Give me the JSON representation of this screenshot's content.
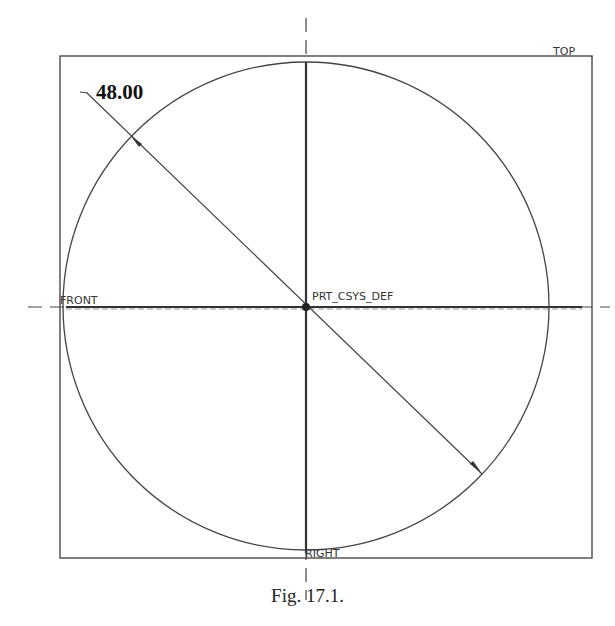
{
  "figure": {
    "caption": "Fig. 17.1.",
    "dimension_value": "48.00",
    "datum_labels": {
      "top": "TOP",
      "front": "FRONT",
      "right": "RIGHT",
      "csys": "PRT_CSYS_DEF"
    },
    "colors": {
      "line": "#444444",
      "text": "#222222",
      "background": "#ffffff"
    }
  }
}
